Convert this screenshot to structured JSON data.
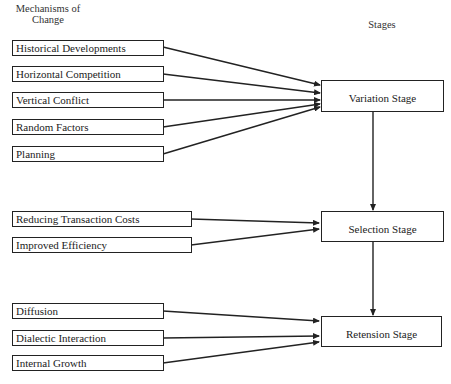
{
  "headers": {
    "mechanisms_line1": "Mechanisms of",
    "mechanisms_line2": "Change",
    "stages": "Stages"
  },
  "stages": [
    {
      "id": "variation",
      "label": "Variation Stage"
    },
    {
      "id": "selection",
      "label": "Selection Stage"
    },
    {
      "id": "retension",
      "label": "Retension Stage"
    }
  ],
  "mechanisms": {
    "variation": [
      {
        "label": "Historical Developments"
      },
      {
        "label": "Horizontal Competition"
      },
      {
        "label": "Vertical Conflict"
      },
      {
        "label": "Random Factors"
      },
      {
        "label": "Planning"
      }
    ],
    "selection": [
      {
        "label": "Reducing Transaction Costs"
      },
      {
        "label": "Improved Efficiency"
      }
    ],
    "retension": [
      {
        "label": "Diffusion"
      },
      {
        "label": "Dialectic Interaction"
      },
      {
        "label": "Internal Growth"
      }
    ]
  },
  "flow": [
    "Variation Stage",
    "Selection Stage",
    "Retension Stage"
  ],
  "colors": {
    "line": "#222222",
    "background": "#ffffff"
  }
}
